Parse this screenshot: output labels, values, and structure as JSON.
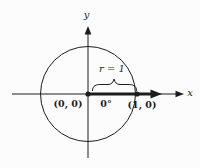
{
  "colors": {
    "ink": "#1c1c1c",
    "background": "#fcfcfc"
  },
  "labels": {
    "x_axis": "x",
    "y_axis": "y",
    "radius": "r = 1",
    "angle": "0°",
    "origin": "(0, 0)",
    "unit_point": "(1, 0)"
  }
}
